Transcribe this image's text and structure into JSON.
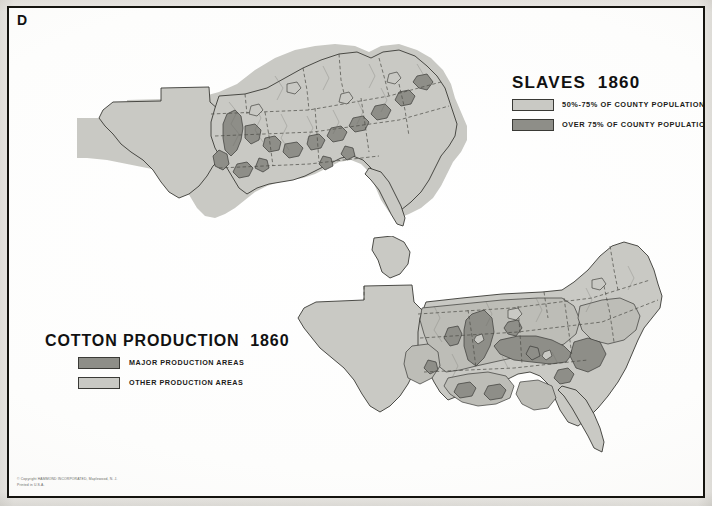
{
  "panel": {
    "letter": "D"
  },
  "imprint": {
    "text": "© Copyright HAMMOND INCORPORATED, Maplewood, N. J.\nPrinted in U.S.A."
  },
  "colors": {
    "light_gray": "#c9c9c4",
    "mid_gray": "#b6b6b0",
    "dark_gray": "#8e8e88",
    "outline": "#3a3a36",
    "paper": "#fdfdfc",
    "border": "#15140f",
    "text": "#111111"
  },
  "legends": [
    {
      "id": "slaves",
      "title": "SLAVES  1860",
      "items": [
        {
          "label": "50%-75% OF COUNTY POPULATION",
          "swatch": "#c9c9c4"
        },
        {
          "label": "OVER 75% OF COUNTY POPULATION",
          "swatch": "#8e8e88"
        }
      ]
    },
    {
      "id": "cotton",
      "title": "COTTON PRODUCTION  1860",
      "items": [
        {
          "label": "MAJOR PRODUCTION AREAS",
          "swatch": "#8e8e88"
        },
        {
          "label": "OTHER PRODUCTION AREAS",
          "swatch": "#c9c9c4"
        }
      ]
    }
  ],
  "maps": [
    {
      "id": "slaves-map",
      "title": "SLAVES 1860",
      "region": "Southern United States",
      "description": "Counties of the American South shaded by enslaved share of county population in 1860; state borders shown as dashed lines."
    },
    {
      "id": "cotton-map",
      "title": "COTTON PRODUCTION 1860",
      "region": "Southern United States",
      "description": "Counties of the American South shaded by cotton production intensity in 1860; state borders shown as dashed lines."
    }
  ]
}
